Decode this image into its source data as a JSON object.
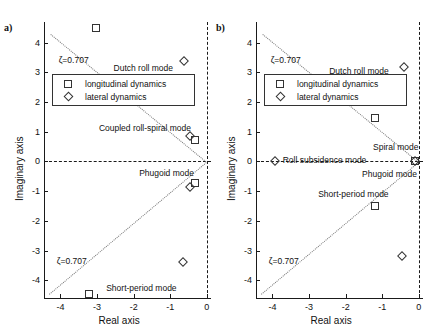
{
  "figure": {
    "panels": [
      {
        "id": "a",
        "label": "a)",
        "xlabel": "Real axis",
        "ylabel": "Imaginary axis",
        "xticks": [
          "-4",
          "-3",
          "-2",
          "-1",
          "0"
        ],
        "xtick_values": [
          -4,
          -3,
          -2,
          -1,
          0
        ],
        "yticks": [
          "4",
          "3",
          "2",
          "1",
          "0",
          "-1",
          "-2",
          "-3",
          "-4"
        ],
        "ytick_values": [
          4,
          3,
          2,
          1,
          0,
          -1,
          -2,
          -3,
          -4
        ],
        "xlim": [
          -4.45,
          -0.05
        ],
        "ylim": [
          -4.6,
          4.7
        ],
        "zeta_label": "ζ=0.707",
        "legend": [
          {
            "marker": "square",
            "label": "longitudinal dynamics"
          },
          {
            "marker": "diamond",
            "label": "lateral dynamics"
          }
        ],
        "annotations": [
          {
            "text": "Dutch roll mode",
            "x": -2.55,
            "y": 3.12
          },
          {
            "text": "Coupled roll-spiral mode",
            "x": -2.95,
            "y": 1.08
          },
          {
            "text": "Phugoid mode",
            "x": -1.85,
            "y": -0.42
          },
          {
            "text": "Short-period mode",
            "x": -2.75,
            "y": -4.3
          }
        ],
        "points": [
          {
            "series": "longitudinal",
            "marker": "square",
            "x": -3.02,
            "y": 4.5
          },
          {
            "series": "lateral",
            "marker": "diamond",
            "x": -0.62,
            "y": 3.4
          },
          {
            "series": "lateral",
            "marker": "diamond",
            "x": -0.47,
            "y": 0.86
          },
          {
            "series": "longitudinal",
            "marker": "square",
            "x": -0.33,
            "y": 0.74
          },
          {
            "series": "longitudinal",
            "marker": "square",
            "x": -0.32,
            "y": -0.73
          },
          {
            "series": "lateral",
            "marker": "diamond",
            "x": -0.46,
            "y": -0.85
          },
          {
            "series": "lateral",
            "marker": "diamond",
            "x": -0.65,
            "y": -3.4
          },
          {
            "series": "longitudinal",
            "marker": "square",
            "x": -3.22,
            "y": -4.48
          }
        ]
      },
      {
        "id": "b",
        "label": "b)",
        "xlabel": "Real axis",
        "ylabel": "Imaginary axis",
        "xticks": [
          "-4",
          "-3",
          "-2",
          "-1",
          "0"
        ],
        "xtick_values": [
          -4,
          -3,
          -2,
          -1,
          0
        ],
        "yticks": [
          "4",
          "3",
          "2",
          "1",
          "0",
          "-1",
          "-2",
          "-3",
          "-4"
        ],
        "ytick_values": [
          4,
          3,
          2,
          1,
          0,
          -1,
          -2,
          -3,
          -4
        ],
        "xlim": [
          -4.45,
          -0.05
        ],
        "ylim": [
          -4.6,
          4.7
        ],
        "zeta_label": "ζ=0.707",
        "legend": [
          {
            "marker": "square",
            "label": "longitudinal dynamics"
          },
          {
            "marker": "diamond",
            "label": "lateral dynamics"
          }
        ],
        "annotations": [
          {
            "text": "Dutch roll mode",
            "x": -2.45,
            "y": 3.0
          },
          {
            "text": "Spiral mode",
            "x": -1.25,
            "y": 0.45
          },
          {
            "text": "Roll subsidence mode",
            "x": -3.72,
            "y": 0.03
          },
          {
            "text": "Phugoid mode",
            "x": -1.55,
            "y": -0.45
          },
          {
            "text": "Short-period mode",
            "x": -2.75,
            "y": -1.12
          }
        ],
        "points": [
          {
            "series": "lateral",
            "marker": "diamond",
            "x": -0.4,
            "y": 3.2
          },
          {
            "series": "longitudinal",
            "marker": "square",
            "x": -1.2,
            "y": 1.48
          },
          {
            "series": "lateral",
            "marker": "diamond",
            "x": -3.92,
            "y": 0.0
          },
          {
            "series": "longitudinal",
            "marker": "square",
            "x": -0.1,
            "y": 0.0
          },
          {
            "series": "lateral",
            "marker": "diamond",
            "x": -0.1,
            "y": 0.0
          },
          {
            "series": "longitudinal",
            "marker": "square",
            "x": -1.2,
            "y": -1.5
          },
          {
            "series": "lateral",
            "marker": "diamond",
            "x": -0.45,
            "y": -3.2
          }
        ]
      }
    ]
  },
  "chart_data": {
    "type": "scatter",
    "title": "",
    "xlabel": "Real axis",
    "ylabel": "Imaginary axis",
    "xlim": [
      -4.45,
      -0.05
    ],
    "ylim": [
      -4.6,
      4.7
    ],
    "grid": false,
    "legend_position": "upper-center",
    "panels": [
      {
        "panel": "a)",
        "series": [
          {
            "name": "longitudinal dynamics",
            "marker": "square",
            "points": [
              [
                -3.02,
                4.5
              ],
              [
                -0.33,
                0.74
              ],
              [
                -0.32,
                -0.73
              ],
              [
                -3.22,
                -4.48
              ]
            ]
          },
          {
            "name": "lateral dynamics",
            "marker": "diamond",
            "points": [
              [
                -0.62,
                3.4
              ],
              [
                -0.47,
                0.86
              ],
              [
                -0.46,
                -0.85
              ],
              [
                -0.65,
                -3.4
              ]
            ]
          }
        ],
        "annotations": [
          "Dutch roll mode",
          "Coupled roll-spiral mode",
          "Phugoid mode",
          "Short-period mode",
          "ζ=0.707"
        ]
      },
      {
        "panel": "b)",
        "series": [
          {
            "name": "longitudinal dynamics",
            "marker": "square",
            "points": [
              [
                -1.2,
                1.48
              ],
              [
                -0.1,
                0.0
              ],
              [
                -1.2,
                -1.5
              ]
            ]
          },
          {
            "name": "lateral dynamics",
            "marker": "diamond",
            "points": [
              [
                -0.4,
                3.2
              ],
              [
                -3.92,
                0.0
              ],
              [
                -0.1,
                0.0
              ],
              [
                -0.45,
                -3.2
              ]
            ]
          }
        ],
        "annotations": [
          "Dutch roll mode",
          "Spiral mode",
          "Roll subsidence mode",
          "Phugoid mode",
          "Short-period mode",
          "ζ=0.707"
        ]
      }
    ]
  }
}
